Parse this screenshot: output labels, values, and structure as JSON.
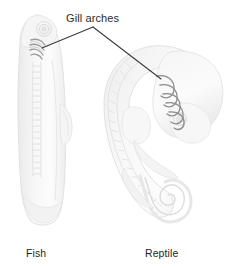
{
  "figure": {
    "type": "comparative-embryology-diagram",
    "background_color": "#ffffff",
    "callout_label": "Gill arches",
    "callout_text_color": "#2b2b2b",
    "leader_line_color": "#3a3a3a",
    "specimens": [
      {
        "id": "fish",
        "caption": "Fish",
        "body_fill": "#f3f4f3",
        "body_stroke": "#e2e4e2",
        "detail_stroke": "#d8dad8",
        "gill_arch_color": "#9a9c9a",
        "gill_arch_count": 4,
        "features": [
          "head",
          "eye",
          "gill-arches",
          "somite-segmented-spine",
          "dorsal-fin-bud",
          "tail"
        ]
      },
      {
        "id": "reptile",
        "caption": "Reptile",
        "body_fill": "#f2f3f2",
        "body_stroke": "#e0e2e0",
        "detail_stroke": "#d6d8d6",
        "gill_arch_color": "#8e908e",
        "gill_arch_count": 5,
        "features": [
          "curved-c-shaped-body",
          "head",
          "eye",
          "gill-arches",
          "somite-segmented-spine",
          "limb-bud",
          "coiled-spiral-tail"
        ]
      }
    ],
    "leader_lines": [
      {
        "from": "callout-apex",
        "to": "fish-gill-arches"
      },
      {
        "from": "callout-apex",
        "to": "reptile-gill-arches"
      }
    ]
  }
}
